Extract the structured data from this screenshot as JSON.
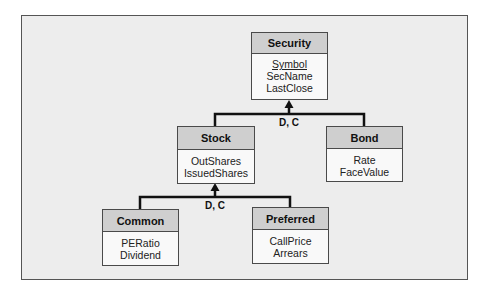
{
  "diagram": {
    "entities": [
      {
        "id": "security",
        "name": "Security",
        "attributes": [
          "Symbol",
          "SecName",
          "LastClose"
        ],
        "key": "Symbol"
      },
      {
        "id": "stock",
        "name": "Stock",
        "attributes": [
          "OutShares",
          "IssuedShares"
        ]
      },
      {
        "id": "bond",
        "name": "Bond",
        "attributes": [
          "Rate",
          "FaceValue"
        ]
      },
      {
        "id": "common",
        "name": "Common",
        "attributes": [
          "PERatio",
          "Dividend"
        ]
      },
      {
        "id": "preferred",
        "name": "Preferred",
        "attributes": [
          "CallPrice",
          "Arrears"
        ]
      }
    ],
    "generalizations": [
      {
        "parent": "Security",
        "children": [
          "Stock",
          "Bond"
        ],
        "label": "D, C"
      },
      {
        "parent": "Stock",
        "children": [
          "Common",
          "Preferred"
        ],
        "label": "D, C"
      }
    ],
    "colors": {
      "frame_bg": "#ededed",
      "header_bg": "#cfcfcf",
      "body_bg": "#f9f9f9",
      "line": "#111111"
    }
  }
}
